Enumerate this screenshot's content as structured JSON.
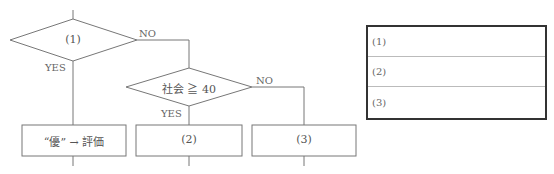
{
  "flowchart": {
    "decision1": {
      "label": "(1)",
      "no_label": "NO",
      "yes_label": "YES"
    },
    "decision2": {
      "label": "社会 ≧ 40",
      "no_label": "NO",
      "yes_label": "YES"
    },
    "process1": {
      "label": "“優” → 評価"
    },
    "process2": {
      "label": "(2)"
    },
    "process3": {
      "label": "(3)"
    }
  },
  "answer_table": {
    "rows": [
      {
        "label": "(1)",
        "value": ""
      },
      {
        "label": "(2)",
        "value": ""
      },
      {
        "label": "(3)",
        "value": ""
      }
    ]
  },
  "colors": {
    "line": "#777777",
    "table_border": "#333333",
    "row_divider": "#bbbbbb"
  }
}
